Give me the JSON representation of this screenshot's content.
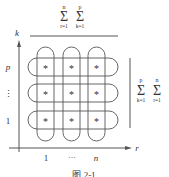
{
  "diagram": {
    "top_sum": {
      "outer": {
        "symbol": "Σ",
        "lower": "r=1",
        "upper": "n"
      },
      "inner": {
        "symbol": "Σ",
        "lower": "k=1",
        "upper": "p"
      }
    },
    "right_sum": {
      "outer": {
        "symbol": "Σ",
        "lower": "k=1",
        "upper": "p"
      },
      "inner": {
        "symbol": "Σ",
        "lower": "r=1",
        "upper": "n"
      }
    },
    "axes": {
      "y_label": "k",
      "x_label": "r",
      "y_ticks": [
        "p",
        "⋮",
        "1"
      ],
      "x_ticks": [
        "1",
        "···",
        "n"
      ]
    },
    "cell_symbol": "*",
    "caption": "图 2-1",
    "colors": {
      "stroke": "#555555",
      "text": "#333333",
      "background": "#ffffff"
    }
  }
}
